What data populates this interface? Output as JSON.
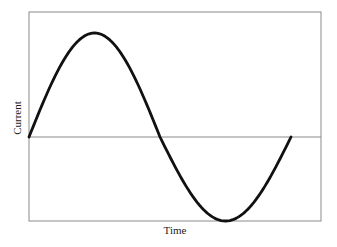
{
  "chart_data": {
    "type": "line",
    "title": "",
    "xlabel": "Time",
    "ylabel": "Current",
    "grid": false,
    "legend": null,
    "ticks": {
      "x": [],
      "y": []
    },
    "series": [
      {
        "name": "Current",
        "description": "One full period of a sine wave starting at zero, rising to a positive peak, crossing zero at mid-period, falling to a negative trough and returning to zero",
        "x": [
          0,
          0.125,
          0.25,
          0.375,
          0.5,
          0.625,
          0.75,
          0.875,
          1.0
        ],
        "values": [
          0,
          0.71,
          1.0,
          0.71,
          0,
          -0.71,
          -1.0,
          -0.71,
          0
        ]
      }
    ],
    "reference_lines": [
      {
        "axis": "y",
        "value": 0,
        "label": ""
      }
    ],
    "colors": {
      "line": "#111111",
      "frame": "#888888",
      "zero_line": "#888888"
    }
  }
}
